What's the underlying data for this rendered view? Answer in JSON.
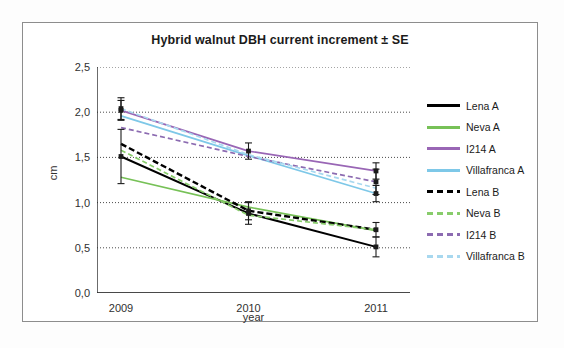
{
  "chart_data": {
    "type": "line",
    "title": "Hybrid walnut DBH current increment ± SE",
    "xlabel": "year",
    "ylabel": "cm",
    "categories": [
      "2009",
      "2010",
      "2011"
    ],
    "ylim": [
      0.0,
      2.5
    ],
    "yticks": [
      "0,0",
      "0,5",
      "1,0",
      "1,5",
      "2,0",
      "2,5"
    ],
    "ytick_values": [
      0.0,
      0.5,
      1.0,
      1.5,
      2.0,
      2.5
    ],
    "grid": "horizontal",
    "legend_position": "right",
    "error_bars": "SE",
    "series": [
      {
        "name": "Lena A",
        "color": "#000000",
        "style": "solid",
        "values": [
          1.51,
          0.88,
          0.51
        ],
        "errors": [
          0.3,
          0.12,
          0.11
        ]
      },
      {
        "name": "Neva A",
        "color": "#77c157",
        "style": "solid",
        "values": [
          1.28,
          0.95,
          0.69
        ],
        "errors": [
          0.0,
          0.0,
          0.0
        ]
      },
      {
        "name": "I214 A",
        "color": "#9966b5",
        "style": "solid",
        "values": [
          2.02,
          1.57,
          1.35
        ],
        "errors": [
          0.11,
          0.09,
          0.09
        ]
      },
      {
        "name": "Villafranca A",
        "color": "#7ec8e8",
        "style": "solid",
        "values": [
          1.96,
          1.52,
          1.1
        ],
        "errors": [
          0.0,
          0.0,
          0.09
        ]
      },
      {
        "name": "Lena B",
        "color": "#000000",
        "style": "dashed",
        "values": [
          1.65,
          0.91,
          0.7
        ],
        "errors": [
          0.0,
          0.1,
          0.08
        ]
      },
      {
        "name": "Neva B",
        "color": "#88cc6b",
        "style": "dashed",
        "values": [
          1.58,
          0.86,
          0.7
        ],
        "errors": [
          0.0,
          0.0,
          0.0
        ]
      },
      {
        "name": "I214 B",
        "color": "#8c6bb1",
        "style": "dashed",
        "values": [
          1.83,
          1.51,
          1.23
        ],
        "errors": [
          0.0,
          0.0,
          0.14
        ]
      },
      {
        "name": "Villafranca B",
        "color": "#a8d8ef",
        "style": "dashed",
        "values": [
          2.04,
          1.53,
          1.16
        ],
        "errors": [
          0.12,
          0.0,
          0.0
        ]
      }
    ]
  },
  "legend": {
    "items": [
      {
        "label": "Lena A"
      },
      {
        "label": "Neva A"
      },
      {
        "label": "I214 A"
      },
      {
        "label": "Villafranca A"
      },
      {
        "label": "Lena B"
      },
      {
        "label": "Neva B"
      },
      {
        "label": "I214 B"
      },
      {
        "label": "Villafranca B"
      }
    ]
  }
}
